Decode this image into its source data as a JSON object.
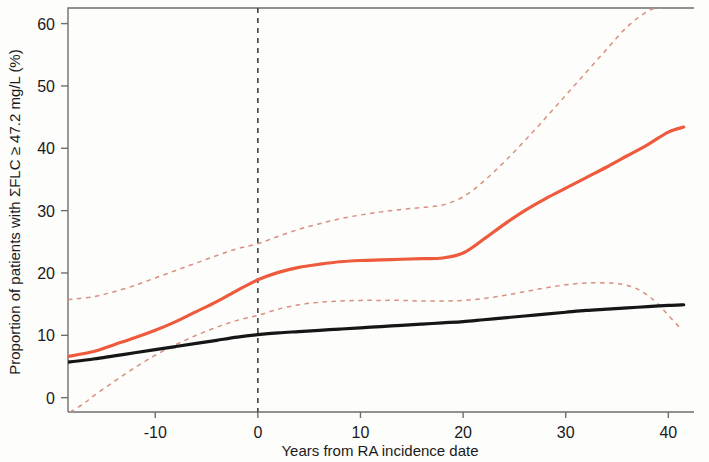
{
  "figure": {
    "background_color": "#fdfdfc",
    "frame_color": "#6e6e6e",
    "text_color": "#1a1a1a"
  },
  "axes": {
    "x_title": "Years from RA incidence date",
    "y_title": "Proportion of patients with ΣFLC ≥ 47.2 mg/L (%)",
    "x_ticks": [
      "-10",
      "0",
      "10",
      "20",
      "30",
      "40"
    ],
    "y_ticks": [
      "0",
      "10",
      "20",
      "30",
      "40",
      "50",
      "60"
    ]
  },
  "reference_line": {
    "label": "RA incidence date",
    "x_value": 0,
    "style": "dashed",
    "color": "#4a4a48"
  },
  "chart_data": {
    "type": "line",
    "title": "",
    "subtitle": "",
    "xlabel": "Years from RA incidence date",
    "ylabel": "Proportion of patients with ΣFLC ≥ 47.2 mg/L (%)",
    "xlim": [
      -18.5,
      42.5
    ],
    "ylim": [
      -2.3,
      62.5
    ],
    "xticks": [
      -10,
      0,
      10,
      20,
      30,
      40
    ],
    "yticks": [
      0,
      10,
      20,
      30,
      40,
      50,
      60
    ],
    "grid": false,
    "legend": "none",
    "annotations": [
      {
        "type": "vline",
        "x": 0,
        "style": "dashed",
        "color": "#4a4a48",
        "label": "RA incidence date"
      }
    ],
    "series": [
      {
        "name": "RA cases (estimate)",
        "color": "#ee5a3c",
        "style": "solid",
        "width": 3.2,
        "x": [
          -18.5,
          -16,
          -14,
          -12,
          -10,
          -8,
          -6,
          -4,
          -2,
          0,
          2,
          4,
          6,
          8,
          10,
          12,
          14,
          16,
          18,
          20,
          22,
          24,
          26,
          28,
          30,
          32,
          34,
          36,
          38,
          40,
          41.5
        ],
        "y": [
          6.6,
          7.4,
          8.5,
          9.6,
          10.8,
          12.2,
          13.8,
          15.4,
          17.2,
          18.9,
          20.1,
          20.9,
          21.4,
          21.8,
          22.0,
          22.1,
          22.2,
          22.3,
          22.4,
          23.2,
          25.4,
          27.8,
          30.0,
          31.9,
          33.6,
          35.3,
          37.0,
          38.8,
          40.6,
          42.6,
          43.4
        ]
      },
      {
        "name": "RA cases 95% CI upper",
        "color": "#d8907f",
        "style": "dashed",
        "width": 1.5,
        "x": [
          -18.5,
          -16,
          -14,
          -12,
          -10,
          -8,
          -6,
          -4,
          -2,
          0,
          2,
          4,
          6,
          8,
          10,
          12,
          14,
          16,
          18,
          20,
          22,
          24,
          26,
          28,
          30,
          32,
          34,
          36,
          38,
          39.2
        ],
        "y": [
          15.7,
          16.2,
          17.0,
          18.0,
          19.2,
          20.4,
          21.6,
          22.8,
          23.9,
          24.7,
          25.9,
          27.0,
          27.9,
          28.7,
          29.3,
          29.8,
          30.2,
          30.5,
          30.9,
          32.2,
          34.7,
          37.8,
          41.2,
          44.8,
          48.5,
          52.2,
          55.9,
          59.5,
          62.0,
          62.5
        ]
      },
      {
        "name": "RA cases 95% CI lower",
        "color": "#d8907f",
        "style": "dashed",
        "width": 1.5,
        "x": [
          -18.3,
          -17,
          -16,
          -14,
          -12,
          -10,
          -8,
          -6,
          -4,
          -2,
          0,
          2,
          4,
          6,
          8,
          10,
          12,
          14,
          16,
          18,
          20,
          22,
          24,
          26,
          28,
          30,
          32,
          34,
          35,
          36,
          37,
          38,
          39,
          40,
          41.2
        ],
        "y": [
          -2.3,
          -1.0,
          0.3,
          2.6,
          4.8,
          6.8,
          8.5,
          10.0,
          11.3,
          12.4,
          13.2,
          14.2,
          14.9,
          15.3,
          15.5,
          15.6,
          15.6,
          15.6,
          15.5,
          15.5,
          15.6,
          15.9,
          16.4,
          17.0,
          17.6,
          18.1,
          18.4,
          18.4,
          18.3,
          18.0,
          17.4,
          16.4,
          15.0,
          13.2,
          11.1
        ]
      },
      {
        "name": "Comparators (estimate)",
        "color": "#161616",
        "style": "solid",
        "width": 3.2,
        "x": [
          -18.5,
          -16,
          -14,
          -12,
          -10,
          -8,
          -6,
          -4,
          -2,
          0,
          2,
          4,
          6,
          8,
          10,
          12,
          14,
          16,
          18,
          20,
          22,
          24,
          26,
          28,
          30,
          32,
          34,
          36,
          38,
          40,
          41.5
        ],
        "y": [
          5.7,
          6.2,
          6.7,
          7.2,
          7.7,
          8.2,
          8.7,
          9.2,
          9.7,
          10.1,
          10.4,
          10.6,
          10.8,
          11.0,
          11.2,
          11.4,
          11.6,
          11.8,
          12.0,
          12.2,
          12.5,
          12.8,
          13.1,
          13.4,
          13.7,
          14.0,
          14.2,
          14.4,
          14.6,
          14.8,
          14.9
        ]
      }
    ]
  }
}
